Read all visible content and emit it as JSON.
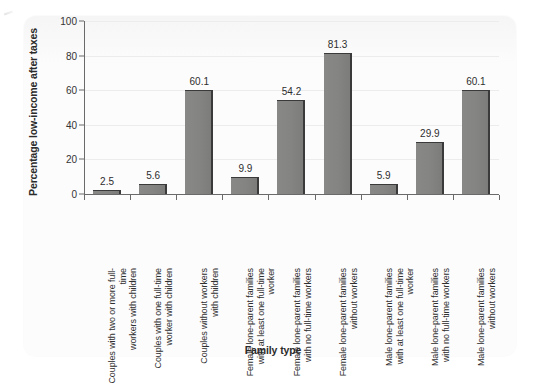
{
  "chart_data": {
    "type": "bar",
    "title": "",
    "xlabel": "Family type",
    "ylabel": "Percentage low-income after taxes",
    "ylim": [
      0,
      100
    ],
    "yticks": [
      0,
      20,
      40,
      60,
      80,
      100
    ],
    "grid": true,
    "legend": null,
    "categories": [
      "Couples with two or more full-time workers with children",
      "Couples with one full-time worker with children",
      "Couples without workers with children",
      "Female lone-parent families with at least one full-time worker",
      "Female lone-parent families with no full-time workers",
      "Female lone-parent families without workers",
      "Male lone-parent families with at least one full-time worker",
      "Male lone-parent families with no full-time workers",
      "Male lone-parent families without workers"
    ],
    "category_lines": [
      [
        "Couples with two or more full-time",
        "workers with children"
      ],
      [
        "Couples with one full-time",
        "worker with children"
      ],
      [
        "Couples without workers",
        "with children"
      ],
      [
        "Female lone-parent families",
        "with at least one full-time",
        "worker"
      ],
      [
        "Female lone-parent families",
        "with no full-time workers"
      ],
      [
        "Female lone-parent families",
        "without workers"
      ],
      [
        "Male lone-parent families",
        "with at least one full-time",
        "worker"
      ],
      [
        "Male lone-parent families",
        "with no full-time workers"
      ],
      [
        "Male lone-parent families",
        "without workers"
      ]
    ],
    "values": [
      2.5,
      5.6,
      60.1,
      9.9,
      54.2,
      81.3,
      5.9,
      29.9,
      60.1
    ],
    "value_labels": [
      "2.5",
      "5.6",
      "60.1",
      "9.9",
      "54.2",
      "81.3",
      "5.9",
      "29.9",
      "60.1"
    ]
  },
  "style": {
    "bar_fill": "#848483",
    "bar_edge": "#3a3a3a",
    "axis_color": "#6a6a6a",
    "grid_color": "#ececec",
    "text_color": "#2b2b2b",
    "panel_background": "#fcfcfc",
    "page_background": "#ffffff"
  }
}
